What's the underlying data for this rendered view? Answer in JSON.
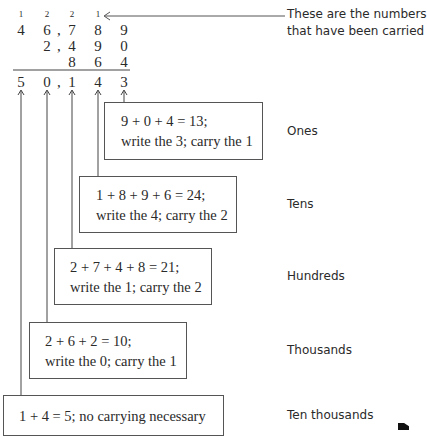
{
  "carries": [
    "1",
    "2",
    "2",
    "1"
  ],
  "addends": [
    [
      "4",
      "6",
      "7",
      "8",
      "9"
    ],
    [
      "",
      "2",
      "4",
      "9",
      "0"
    ],
    [
      "",
      "",
      "8",
      "6",
      "4"
    ]
  ],
  "sum": [
    "5",
    "0",
    "1",
    "4",
    "3"
  ],
  "separator": ",",
  "carry_note": "These are the numbers that have been carried",
  "carry_note_lines": [
    "These are the numbers",
    "that have been carried"
  ],
  "steps": [
    {
      "place": "Ones",
      "line1": "9 + 0 + 4 = 13;",
      "line2": "write the 3; carry the 1"
    },
    {
      "place": "Tens",
      "line1": "1 + 8 + 9 + 6 = 24;",
      "line2": "write the 4; carry the 2"
    },
    {
      "place": "Hundreds",
      "line1": "2 + 7 + 4 + 8 = 21;",
      "line2": "write the 1; carry the 2"
    },
    {
      "place": "Thousands",
      "line1": "2 + 6 + 2 = 10;",
      "line2": "write the 0; carry the 1"
    },
    {
      "place": "Ten thousands",
      "line1": "1 + 4 = 5; no carrying necessary",
      "line2": ""
    }
  ]
}
